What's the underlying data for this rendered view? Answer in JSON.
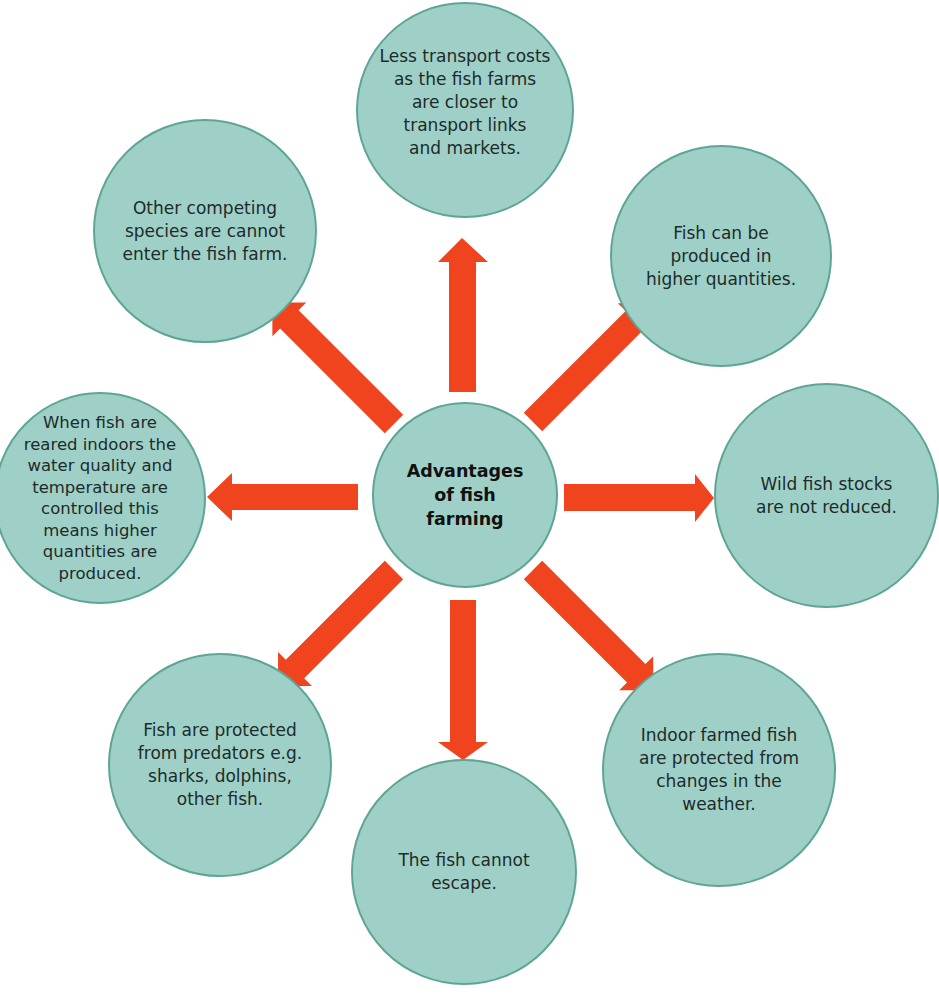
{
  "diagram": {
    "title": "Advantages of fish farming",
    "center": {
      "label": "Advantages\nof fish\nfarming"
    },
    "nodes": {
      "top": {
        "label": "Less transport costs\nas the fish farms\nare closer to\ntransport links\nand markets."
      },
      "top_right": {
        "label": "Fish can be\nproduced in\nhigher quantities."
      },
      "right": {
        "label": "Wild fish stocks\nare not reduced."
      },
      "bottom_right": {
        "label": "Indoor farmed fish\nare protected from\nchanges in the\nweather."
      },
      "bottom": {
        "label": "The fish cannot\nescape."
      },
      "bottom_left": {
        "label": "Fish are protected\nfrom predators e.g.\nsharks, dolphins,\nother fish."
      },
      "left": {
        "label": "When fish are\nreared indoors the\nwater quality and\ntemperature are\ncontrolled this\nmeans higher\nquantities are\nproduced."
      },
      "top_left": {
        "label": "Other competing\nspecies are cannot\nenter the fish farm."
      }
    },
    "colors": {
      "circle_fill": "#9fd0c7",
      "circle_border": "#5ea596",
      "arrow": "#f0441e",
      "text": "#1d2b2a"
    }
  }
}
